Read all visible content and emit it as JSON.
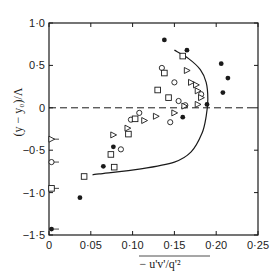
{
  "chart_data": {
    "type": "scatter",
    "title": "",
    "xlabel": "− u'v'/q'²",
    "ylabel": "(y − y₀)/Λ",
    "xlim": [
      0,
      0.25
    ],
    "ylim": [
      -1.5,
      1.0
    ],
    "x_ticks": [
      0,
      0.05,
      0.1,
      0.15,
      0.2,
      0.25
    ],
    "x_tick_labels": [
      "0",
      "0·05",
      "0·10",
      "0·15",
      "0·20",
      "0·25"
    ],
    "y_ticks": [
      1.0,
      0.5,
      0,
      -0.5,
      -1.0,
      -1.5
    ],
    "y_tick_labels": [
      "1·0",
      "0·5",
      "0",
      "−0·5",
      "−1·0",
      "−1·5"
    ],
    "grid": false,
    "reference_line": {
      "y": 0,
      "style": "dashed"
    },
    "series": [
      {
        "name": "filled-circles",
        "marker": "filled-circle",
        "points": [
          [
            0.138,
            0.8
          ],
          [
            0.165,
            0.68
          ],
          [
            0.206,
            0.52
          ],
          [
            0.214,
            0.35
          ],
          [
            0.208,
            0.18
          ],
          [
            0.189,
            0.04
          ],
          [
            0.16,
            -0.11
          ],
          [
            0.077,
            -0.46
          ],
          [
            0.065,
            -0.69
          ],
          [
            0.037,
            -1.06
          ],
          [
            0.003,
            -1.43
          ]
        ]
      },
      {
        "name": "open-circles",
        "marker": "open-circle",
        "points": [
          [
            0.135,
            0.47
          ],
          [
            0.15,
            0.3
          ],
          [
            0.182,
            0.16
          ],
          [
            0.155,
            0.08
          ],
          [
            0.163,
            0.03
          ],
          [
            0.145,
            -0.17
          ],
          [
            0.108,
            -0.06
          ],
          [
            0.086,
            -0.49
          ],
          [
            0.098,
            -0.14
          ],
          [
            0.003,
            -0.64
          ]
        ]
      },
      {
        "name": "open-squares",
        "marker": "open-square",
        "points": [
          [
            0.16,
            0.61
          ],
          [
            0.138,
            0.41
          ],
          [
            0.143,
            0.12
          ],
          [
            0.13,
            0.21
          ],
          [
            0.103,
            -0.13
          ],
          [
            0.095,
            -0.31
          ],
          [
            0.074,
            -0.55
          ],
          [
            0.078,
            -0.7
          ],
          [
            0.042,
            -0.81
          ],
          [
            0.003,
            -0.95
          ]
        ]
      },
      {
        "name": "open-triangles",
        "marker": "open-triangle",
        "points": [
          [
            0.165,
            0.44
          ],
          [
            0.17,
            0.3
          ],
          [
            0.176,
            0.27
          ],
          [
            0.178,
            0.2
          ],
          [
            0.182,
            0.12
          ],
          [
            0.178,
            0.04
          ],
          [
            0.162,
            0.02
          ],
          [
            0.15,
            -0.06
          ],
          [
            0.128,
            -0.1
          ],
          [
            0.114,
            -0.15
          ],
          [
            0.094,
            -0.24
          ],
          [
            0.077,
            -0.32
          ],
          [
            0.003,
            -0.37
          ]
        ]
      }
    ],
    "curve": {
      "name": "fitted-curve",
      "style": "solid",
      "points": [
        [
          0.15,
          0.68
        ],
        [
          0.167,
          0.58
        ],
        [
          0.181,
          0.45
        ],
        [
          0.188,
          0.3
        ],
        [
          0.19,
          0.1
        ],
        [
          0.188,
          -0.1
        ],
        [
          0.183,
          -0.3
        ],
        [
          0.17,
          -0.52
        ],
        [
          0.15,
          -0.64
        ],
        [
          0.11,
          -0.72
        ],
        [
          0.06,
          -0.78
        ],
        [
          0.052,
          -0.79
        ]
      ]
    },
    "axes_px": {
      "x0": 49,
      "x1": 258,
      "y_top": 23,
      "y_bottom": 235
    }
  }
}
